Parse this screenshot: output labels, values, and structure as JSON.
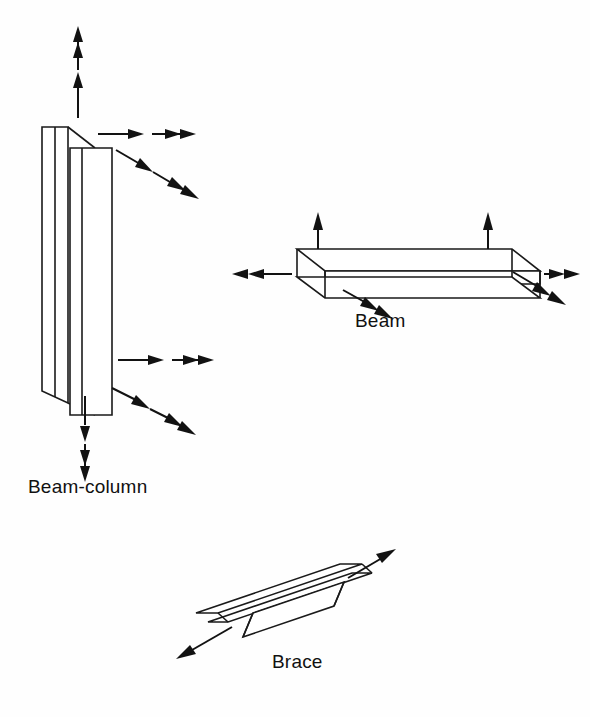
{
  "figure": {
    "background_color": "#fefefe",
    "line_color": "#1a1a1a",
    "arrow_color": "#121212"
  },
  "members": [
    {
      "id": "beam-column",
      "label": "Beam-column",
      "shape": "wide-flange-I-section",
      "orientation": "vertical",
      "loads": [
        {
          "name": "axial-force-top",
          "type": "force",
          "direction": "up",
          "heads": 1
        },
        {
          "name": "moment-top",
          "type": "moment",
          "direction": "up",
          "heads": 2
        },
        {
          "name": "shear-force-top",
          "type": "force",
          "direction": "right",
          "heads": 1
        },
        {
          "name": "moment-top-lateral",
          "type": "moment",
          "direction": "right",
          "heads": 2
        },
        {
          "name": "force-top-oblique",
          "type": "force",
          "direction": "down-right",
          "heads": 1
        },
        {
          "name": "moment-top-oblique",
          "type": "moment",
          "direction": "down-right",
          "heads": 2
        },
        {
          "name": "shear-force-bottom",
          "type": "force",
          "direction": "right",
          "heads": 1
        },
        {
          "name": "moment-bottom-lateral",
          "type": "moment",
          "direction": "right",
          "heads": 2
        },
        {
          "name": "force-bottom-oblique",
          "type": "force",
          "direction": "down-right",
          "heads": 1
        },
        {
          "name": "moment-bottom-oblique",
          "type": "moment",
          "direction": "down-right",
          "heads": 2
        },
        {
          "name": "axial-force-bottom",
          "type": "force",
          "direction": "down",
          "heads": 1
        },
        {
          "name": "moment-bottom",
          "type": "moment",
          "direction": "down",
          "heads": 2
        }
      ]
    },
    {
      "id": "beam",
      "label": "Beam",
      "shape": "wide-flange-I-section",
      "orientation": "horizontal",
      "loads": [
        {
          "name": "shear-force-left-end",
          "type": "force",
          "direction": "up",
          "heads": 1
        },
        {
          "name": "shear-force-right-end",
          "type": "force",
          "direction": "up",
          "heads": 1
        },
        {
          "name": "moment-left-end",
          "type": "moment",
          "direction": "left",
          "heads": 2
        },
        {
          "name": "moment-right-end",
          "type": "moment",
          "direction": "right",
          "heads": 2
        },
        {
          "name": "moment-left-oblique",
          "type": "moment",
          "direction": "down-right",
          "heads": 2
        },
        {
          "name": "moment-right-oblique",
          "type": "moment",
          "direction": "down-right",
          "heads": 2
        }
      ]
    },
    {
      "id": "brace",
      "label": "Brace",
      "shape": "tee-section",
      "orientation": "diagonal",
      "loads": [
        {
          "name": "axial-force-upper",
          "type": "force",
          "direction": "up-right",
          "heads": 1
        },
        {
          "name": "axial-force-lower",
          "type": "force",
          "direction": "down-left",
          "heads": 1
        }
      ]
    }
  ],
  "captions": {
    "beam_column": "Beam-column",
    "beam": "Beam",
    "brace": "Brace"
  }
}
